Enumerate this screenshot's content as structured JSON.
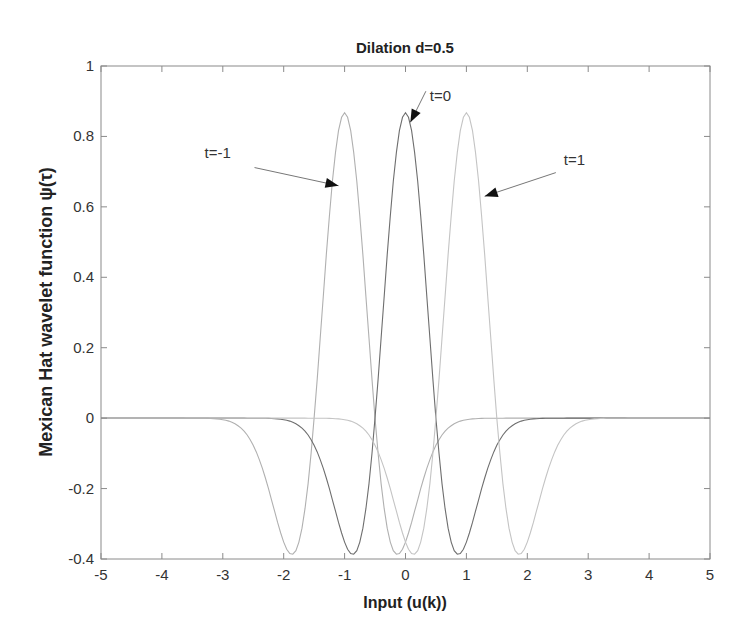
{
  "chart_data": {
    "type": "line",
    "title": "Dilation d=0.5",
    "xlabel": "Input (u(k))",
    "ylabel": "Mexican Hat wavelet function   ψ(τ)",
    "xlim": [
      -5,
      5
    ],
    "ylim": [
      -0.4,
      1
    ],
    "xticks": [
      -5,
      -4,
      -3,
      -2,
      -1,
      0,
      1,
      2,
      3,
      4,
      5
    ],
    "yticks": [
      -0.4,
      -0.2,
      0,
      0.2,
      0.4,
      0.6,
      0.8,
      1
    ],
    "ytick_labels": [
      "-0.4",
      "-0.2",
      "0",
      "0.2",
      "0.4",
      "0.6",
      "0.8",
      "1"
    ],
    "grid": false,
    "legend": null,
    "dilation": 0.5,
    "series": [
      {
        "name": "t=-1",
        "translation": -1,
        "color": "#b0b0b0",
        "peak": {
          "x": -1,
          "y": 0.867
        },
        "minima": [
          {
            "x": -1.87,
            "y": -0.387
          },
          {
            "x": -0.13,
            "y": -0.387
          }
        ]
      },
      {
        "name": "t=0",
        "translation": 0,
        "color": "#6e6e6e",
        "peak": {
          "x": 0,
          "y": 0.867
        },
        "minima": [
          {
            "x": -0.87,
            "y": -0.387
          },
          {
            "x": 0.87,
            "y": -0.387
          }
        ]
      },
      {
        "name": "t=1",
        "translation": 1,
        "color": "#c4c4c4",
        "peak": {
          "x": 1,
          "y": 0.867
        },
        "minima": [
          {
            "x": 0.13,
            "y": -0.387
          },
          {
            "x": 1.87,
            "y": -0.387
          }
        ]
      }
    ],
    "annotations": [
      {
        "text": "t=-1",
        "label_xy": [
          -3.3,
          0.74
        ],
        "arrow_to": [
          -1.1,
          0.66
        ]
      },
      {
        "text": "t=0",
        "label_xy": [
          0.4,
          0.9
        ],
        "arrow_to": [
          0.08,
          0.84
        ]
      },
      {
        "text": "t=1",
        "label_xy": [
          2.6,
          0.72
        ],
        "arrow_to": [
          1.3,
          0.63
        ]
      }
    ]
  }
}
